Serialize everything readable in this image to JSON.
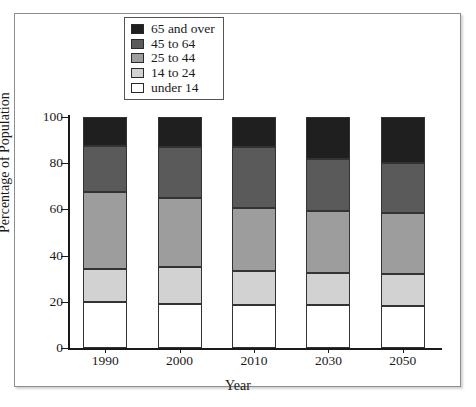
{
  "chart_data": {
    "type": "bar",
    "subtype": "stacked-bar",
    "title": "",
    "xlabel": "Year",
    "ylabel": "Percentage of Population",
    "categories": [
      "1990",
      "2000",
      "2010",
      "2030",
      "2050"
    ],
    "ylim": [
      0,
      100
    ],
    "yticks": [
      "0",
      "20",
      "40",
      "60",
      "80",
      "100"
    ],
    "grid": false,
    "legend_position": "top-center",
    "stack_order_bottom_to_top": [
      "under 14",
      "14 to 24",
      "25 to 44",
      "45 to 64",
      "65 and over"
    ],
    "series": [
      {
        "name": "under 14",
        "color": "#ffffff",
        "values": [
          20.0,
          19.0,
          18.5,
          18.5,
          18.0
        ]
      },
      {
        "name": "14 to 24",
        "color": "#d2d2d2",
        "values": [
          14.0,
          16.0,
          15.0,
          14.0,
          14.0
        ]
      },
      {
        "name": "25 to 44",
        "color": "#9d9d9d",
        "values": [
          33.5,
          30.0,
          27.0,
          27.0,
          26.5
        ]
      },
      {
        "name": "45 to 64",
        "color": "#5a5a5a",
        "values": [
          20.0,
          22.0,
          26.5,
          22.5,
          21.5
        ]
      },
      {
        "name": "65 and over",
        "color": "#1f1f1f",
        "values": [
          12.5,
          13.0,
          13.0,
          18.0,
          20.0
        ]
      }
    ]
  },
  "legend": {
    "items": [
      {
        "label": "65 and over",
        "color": "#1f1f1f"
      },
      {
        "label": "45 to 64",
        "color": "#5a5a5a"
      },
      {
        "label": "25 to 44",
        "color": "#9d9d9d"
      },
      {
        "label": "14 to 24",
        "color": "#d2d2d2"
      },
      {
        "label": "under 14",
        "color": "#ffffff"
      }
    ]
  },
  "axes": {
    "xlabel": "Year",
    "ylabel": "Percentage of Population"
  },
  "colors": {
    "frame": "#8d8d8d",
    "axis": "#1a1a1a",
    "segment_border": "#333333",
    "background": "#ffffff"
  }
}
